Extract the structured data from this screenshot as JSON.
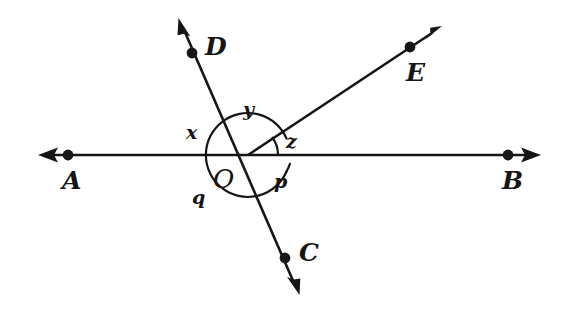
{
  "figure": {
    "background_color": "#ffffff",
    "ink_color": "#161616",
    "width": 568,
    "height": 310
  },
  "points": {
    "A": {
      "label": "A",
      "x": 68,
      "y": 155,
      "label_x": 62,
      "label_y": 168
    },
    "B": {
      "label": "B",
      "x": 508,
      "y": 155,
      "label_x": 502,
      "label_y": 168
    },
    "C": {
      "label": "C",
      "x": 285,
      "y": 258,
      "label_x": 299,
      "label_y": 240
    },
    "D": {
      "label": "D",
      "x": 192,
      "y": 53,
      "label_x": 205,
      "label_y": 34
    },
    "E": {
      "label": "E",
      "x": 410,
      "y": 47,
      "label_x": 406,
      "label_y": 60
    },
    "O": {
      "label": "O",
      "x": 248,
      "y": 155,
      "label_x": 213,
      "label_y": 166
    }
  },
  "angles": [
    {
      "name": "x",
      "label": "x",
      "label_x": 186,
      "label_y": 123,
      "description": "angle between ray OA and ray OD"
    },
    {
      "name": "y",
      "label": "y",
      "label_x": 243,
      "label_y": 100,
      "description": "angle between ray OD and ray OE"
    },
    {
      "name": "z",
      "label": "z",
      "label_x": 286,
      "label_y": 132,
      "description": "angle between ray OE and ray OB"
    },
    {
      "name": "p",
      "label": "p",
      "label_x": 274,
      "label_y": 172,
      "description": "angle between ray OB and ray OC"
    },
    {
      "name": "q",
      "label": "q",
      "label_x": 192,
      "label_y": 188,
      "description": "angle between ray OC and ray OA"
    }
  ],
  "lines": [
    {
      "name": "line-AB",
      "from": "A",
      "through": "O",
      "to": "B",
      "arrows": "both",
      "orientation": "horizontal"
    },
    {
      "name": "line-DC",
      "from": "D",
      "through": "O",
      "to": "C",
      "arrows": "both",
      "orientation": "oblique"
    },
    {
      "name": "ray-OE",
      "from": "O",
      "to": "E",
      "arrows": "end",
      "orientation": "oblique"
    }
  ],
  "arcs": [
    {
      "name": "main-angle-arc",
      "center": "O",
      "radius": 42,
      "description": "circular arc marking all five angles at O"
    },
    {
      "name": "z-angle-arc",
      "center": "O",
      "radius": 30,
      "description": "small arc marking angle z between OE and OB"
    }
  ]
}
